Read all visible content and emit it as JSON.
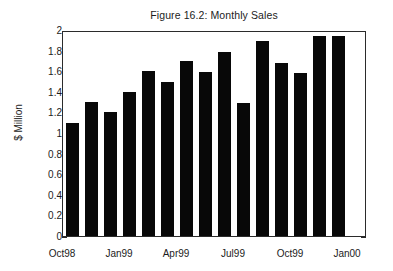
{
  "chart_data": {
    "type": "bar",
    "title": "Figure 16.2: Monthly Sales",
    "xlabel": "",
    "ylabel": "$ Million",
    "ylim": [
      0,
      2
    ],
    "ytick_values": [
      0,
      0.2,
      0.4,
      0.6,
      0.8,
      1,
      1.2,
      1.4,
      1.6,
      1.8,
      2
    ],
    "ytick_labels": [
      "0",
      "0.2",
      "0.4",
      "0.6",
      "0.8",
      "1",
      "1.2",
      "1.4",
      "1.6",
      "1.8",
      "2"
    ],
    "grid": false,
    "legend": null,
    "bar_color": "#080808",
    "axis_color": "#2b2b2b",
    "categories": [
      "Oct98",
      "Nov98",
      "Dec98",
      "Jan99",
      "Feb99",
      "Mar99",
      "Apr99",
      "May99",
      "Jun99",
      "Jul99",
      "Aug99",
      "Sep99",
      "Oct99",
      "Nov99",
      "Dec99"
    ],
    "values": [
      1.1,
      1.3,
      1.2,
      1.4,
      1.6,
      1.5,
      1.7,
      1.59,
      1.79,
      1.29,
      1.89,
      1.68,
      1.58,
      1.94,
      1.94
    ],
    "xtick_labels": [
      "Oct98",
      "Jan99",
      "Apr99",
      "Jul99",
      "Oct99",
      "Jan00"
    ],
    "xtick_categories": [
      "Oct98",
      "Jan99",
      "Apr99",
      "Jul99",
      "Oct99",
      "Jan00"
    ]
  }
}
